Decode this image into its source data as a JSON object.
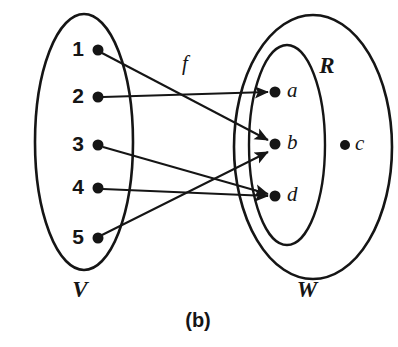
{
  "figure": {
    "caption": "(b)",
    "function_label": "f",
    "stroke_color": "#151515",
    "background_color": "#ffffff"
  },
  "domain_set": {
    "name": "V",
    "label": "V",
    "ellipse": {
      "cx": 84,
      "cy": 142,
      "rx": 49,
      "ry": 128,
      "stroke_width": 2.6
    },
    "label_pos": {
      "x": 80,
      "y": 292
    },
    "elements": [
      {
        "id": "1",
        "label": "1",
        "dot": {
          "x": 98,
          "y": 50,
          "r": 5.5
        },
        "label_pos": {
          "x": 78,
          "y": 50
        }
      },
      {
        "id": "2",
        "label": "2",
        "dot": {
          "x": 98,
          "y": 97,
          "r": 5.5
        },
        "label_pos": {
          "x": 78,
          "y": 97
        }
      },
      {
        "id": "3",
        "label": "3",
        "dot": {
          "x": 98,
          "y": 145,
          "r": 5.5
        },
        "label_pos": {
          "x": 78,
          "y": 145
        }
      },
      {
        "id": "4",
        "label": "4",
        "dot": {
          "x": 98,
          "y": 188,
          "r": 5.5
        },
        "label_pos": {
          "x": 78,
          "y": 188
        }
      },
      {
        "id": "5",
        "label": "5",
        "dot": {
          "x": 98,
          "y": 238,
          "r": 5.5
        },
        "label_pos": {
          "x": 78,
          "y": 238
        }
      }
    ]
  },
  "codomain_set": {
    "name": "W",
    "label": "W",
    "ellipse": {
      "cx": 313,
      "cy": 147,
      "rx": 79,
      "ry": 132,
      "stroke_width": 2.6
    },
    "label_pos": {
      "x": 307,
      "y": 292
    },
    "elements": [
      {
        "id": "a",
        "label": "a",
        "dot": {
          "x": 275,
          "y": 92,
          "r": 5.5
        },
        "label_pos": {
          "x": 287,
          "y": 92
        },
        "in_range": true
      },
      {
        "id": "b",
        "label": "b",
        "dot": {
          "x": 275,
          "y": 144,
          "r": 5.5
        },
        "label_pos": {
          "x": 287,
          "y": 144
        },
        "in_range": true
      },
      {
        "id": "d",
        "label": "d",
        "dot": {
          "x": 275,
          "y": 196,
          "r": 5.5
        },
        "label_pos": {
          "x": 287,
          "y": 196
        },
        "in_range": true
      },
      {
        "id": "c",
        "label": "c",
        "dot": {
          "x": 345,
          "y": 145,
          "r": 5.0
        },
        "label_pos": {
          "x": 355,
          "y": 145
        },
        "in_range": false
      }
    ]
  },
  "range_set": {
    "name": "R",
    "label": "R",
    "ellipse": {
      "cx": 287,
      "cy": 145,
      "rx": 38,
      "ry": 100,
      "stroke_width": 2.4
    },
    "label_pos": {
      "x": 327,
      "y": 68
    }
  },
  "function_label_pos": {
    "x": 185,
    "y": 65
  },
  "caption_pos": {
    "x": 198,
    "y": 322
  },
  "mappings": [
    {
      "from": "1",
      "to": "b",
      "x1": 102,
      "y1": 53,
      "x2": 268,
      "y2": 140
    },
    {
      "from": "2",
      "to": "a",
      "x1": 103,
      "y1": 97,
      "x2": 268,
      "y2": 92
    },
    {
      "from": "3",
      "to": "d",
      "x1": 103,
      "y1": 147,
      "x2": 268,
      "y2": 194
    },
    {
      "from": "4",
      "to": "d",
      "x1": 103,
      "y1": 189,
      "x2": 268,
      "y2": 196
    },
    {
      "from": "5",
      "to": "b",
      "x1": 102,
      "y1": 235,
      "x2": 268,
      "y2": 152
    }
  ]
}
